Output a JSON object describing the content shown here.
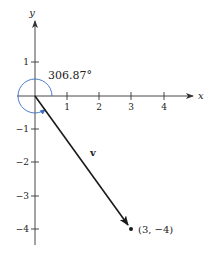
{
  "figure": {
    "type": "vector-diagram",
    "axes": {
      "x_label": "x",
      "y_label": "y",
      "x_ticks": [
        "1",
        "2",
        "3",
        "4"
      ],
      "y_ticks": [
        "1",
        "−1",
        "−2",
        "−3",
        "−4"
      ]
    },
    "vector": {
      "label": "v",
      "from": [
        0,
        0
      ],
      "to": [
        3,
        -4
      ]
    },
    "point": {
      "label": "(3,  −4)"
    },
    "angle": {
      "label": "306.87°",
      "degrees": 306.87
    },
    "colors": {
      "axes": "#333333",
      "vector": "#1a1a1a",
      "arc": "#3a6fc4"
    }
  }
}
